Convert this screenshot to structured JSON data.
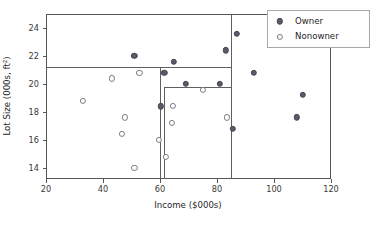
{
  "chart_data": {
    "type": "scatter",
    "title": "",
    "xlabel": "Income ($000s)",
    "ylabel": "Lot Size (000s, ft²)",
    "xlim": [
      20,
      120
    ],
    "ylim": [
      13.2,
      25.0
    ],
    "xticks": [
      20,
      40,
      60,
      80,
      100,
      120
    ],
    "yticks": [
      14,
      16,
      18,
      20,
      22,
      24
    ],
    "xtick_labels": [
      "20",
      "40",
      "60",
      "80",
      "100",
      "120"
    ],
    "ytick_labels": [
      "14",
      "16",
      "18",
      "20",
      "22",
      "24"
    ],
    "grid": false,
    "legend_position": "upper right",
    "series": [
      {
        "name": "Owner",
        "marker": "filled-circle",
        "color": "#5a5a68",
        "points": [
          {
            "x": 51.0,
            "y": 22.0
          },
          {
            "x": 64.8,
            "y": 21.6
          },
          {
            "x": 61.5,
            "y": 20.8
          },
          {
            "x": 60.3,
            "y": 18.4
          },
          {
            "x": 69.0,
            "y": 20.0
          },
          {
            "x": 81.0,
            "y": 20.0
          },
          {
            "x": 83.0,
            "y": 22.4
          },
          {
            "x": 87.0,
            "y": 23.6
          },
          {
            "x": 85.5,
            "y": 16.8
          },
          {
            "x": 93.0,
            "y": 20.8
          },
          {
            "x": 108.0,
            "y": 17.6
          },
          {
            "x": 110.0,
            "y": 19.2
          }
        ]
      },
      {
        "name": "Nonowner",
        "marker": "open-circle",
        "color": "#7a7a85",
        "points": [
          {
            "x": 33.0,
            "y": 18.8
          },
          {
            "x": 43.0,
            "y": 20.4
          },
          {
            "x": 52.8,
            "y": 20.8
          },
          {
            "x": 47.8,
            "y": 17.6
          },
          {
            "x": 46.5,
            "y": 16.4
          },
          {
            "x": 51.0,
            "y": 14.0
          },
          {
            "x": 59.6,
            "y": 16.0
          },
          {
            "x": 64.5,
            "y": 18.4
          },
          {
            "x": 64.2,
            "y": 17.2
          },
          {
            "x": 62.0,
            "y": 14.8
          },
          {
            "x": 75.0,
            "y": 19.6
          },
          {
            "x": 83.5,
            "y": 17.6
          }
        ]
      }
    ],
    "partition_lines": [
      {
        "orientation": "vertical",
        "value": 60.0,
        "y_from": 13.2,
        "y_to": 21.2
      },
      {
        "orientation": "vertical",
        "value": 61.5,
        "y_from": 13.2,
        "y_to": 19.8
      },
      {
        "orientation": "vertical",
        "value": 85.0,
        "y_from": 13.2,
        "y_to": 25.0
      },
      {
        "orientation": "horizontal",
        "value": 21.2,
        "x_from": 20.0,
        "x_to": 85.0
      },
      {
        "orientation": "horizontal",
        "value": 19.8,
        "x_from": 61.5,
        "x_to": 85.0
      }
    ]
  },
  "legend": {
    "entries": [
      {
        "label": "Owner",
        "marker": "filled-circle"
      },
      {
        "label": "Nonowner",
        "marker": "open-circle"
      }
    ]
  }
}
